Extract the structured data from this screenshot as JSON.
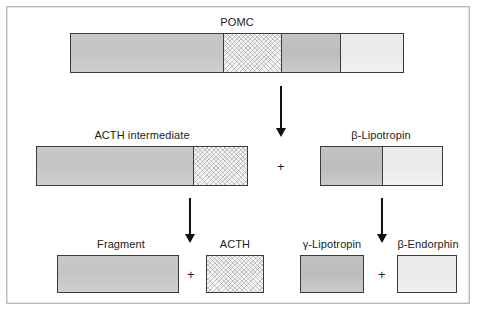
{
  "diagram": {
    "title_molecule": "POMC",
    "rows": {
      "top": {
        "label": "POMC",
        "segments": [
          {
            "name": "fragment-segment",
            "fill": "gray"
          },
          {
            "name": "acth-segment",
            "fill": "texture"
          },
          {
            "name": "gamma-lipotropin-segment",
            "fill": "gray-d"
          },
          {
            "name": "beta-endorphin-segment",
            "fill": "pale"
          }
        ]
      },
      "middle": [
        {
          "label": "ACTH intermediate",
          "segments": [
            {
              "name": "fragment-segment",
              "fill": "gray"
            },
            {
              "name": "acth-segment",
              "fill": "texture"
            }
          ]
        },
        {
          "label": "β-Lipotropin",
          "segments": [
            {
              "name": "gamma-lipotropin-segment",
              "fill": "gray-d"
            },
            {
              "name": "beta-endorphin-segment",
              "fill": "pale"
            }
          ]
        }
      ],
      "bottom": [
        {
          "label": "Fragment",
          "fill": "gray"
        },
        {
          "label": "ACTH",
          "fill": "texture"
        },
        {
          "label": "γ-Lipotropin",
          "fill": "gray-d"
        },
        {
          "label": "β-Endorphin",
          "fill": "pale"
        }
      ]
    },
    "operators": {
      "plus_middle": "+",
      "plus_bottom_left": "+",
      "plus_bottom_right": "+"
    },
    "colors": {
      "outline": "#3b3b3b",
      "arrow": "#111111",
      "text": "#1b1b1b",
      "frame": "#b9b9b9",
      "gray": "#c6c6c6",
      "gray_dark": "#c0c0c0",
      "pale": "#ececec",
      "texture_bg": "#f4f4f4"
    }
  }
}
